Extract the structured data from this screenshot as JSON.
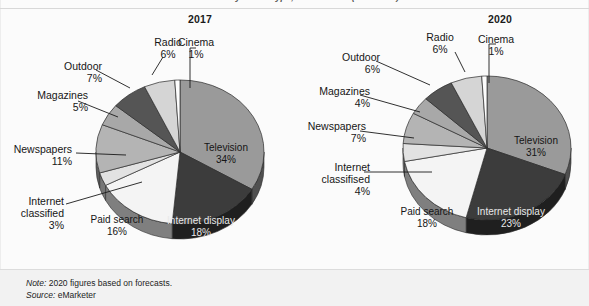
{
  "figure": {
    "clipped_header": "ad share by media type, 2017 & 2020 (% of total)",
    "note": {
      "lead": "Note:",
      "text": " 2020 figures based on forecasts."
    },
    "source": {
      "lead": "Source:",
      "text": " eMarketer"
    }
  },
  "panels": {
    "left": {
      "title": "2017"
    },
    "right": {
      "title": "2020"
    }
  },
  "labels": {
    "y2017": {
      "cinema": {
        "name": "Cinema",
        "pct": "1%"
      },
      "radio": {
        "name": "Radio",
        "pct": "6%"
      },
      "outdoor": {
        "name": "Outdoor",
        "pct": "7%"
      },
      "magazines": {
        "name": "Magazines",
        "pct": "5%"
      },
      "newspapers": {
        "name": "Newspapers",
        "pct": "11%"
      },
      "internet_classified": {
        "name1": "Internet",
        "name2": "classified",
        "pct": "3%"
      },
      "paid_search": {
        "name": "Paid search",
        "pct": "16%"
      },
      "internet_display": {
        "name": "Internet display",
        "pct": "18%"
      },
      "television": {
        "name": "Television",
        "pct": "34%"
      }
    },
    "y2020": {
      "cinema": {
        "name": "Cinema",
        "pct": "1%"
      },
      "radio": {
        "name": "Radio",
        "pct": "6%"
      },
      "outdoor": {
        "name": "Outdoor",
        "pct": "6%"
      },
      "magazines": {
        "name": "Magazines",
        "pct": "4%"
      },
      "newspapers": {
        "name": "Newspapers",
        "pct": "7%"
      },
      "internet_classified": {
        "name1": "Internet",
        "name2": "classifised",
        "pct": "4%"
      },
      "paid_search": {
        "name": "Paid search",
        "pct": "18%"
      },
      "internet_display": {
        "name": "Internet display",
        "pct": "23%"
      },
      "television": {
        "name": "Television",
        "pct": "31%"
      }
    }
  },
  "chart_data": {
    "type": "pie",
    "title": "ad share by media type, 2017 & 2020 (% of total)",
    "note": "2020 figures based on forecasts.",
    "source": "eMarketer",
    "unit": "% of total",
    "categories": [
      "Television",
      "Internet display",
      "Paid search",
      "Internet classified",
      "Newspapers",
      "Magazines",
      "Outdoor",
      "Radio",
      "Cinema"
    ],
    "charts": [
      {
        "title": "2017",
        "categories": [
          "Television",
          "Internet display",
          "Paid search",
          "Internet classified",
          "Newspapers",
          "Magazines",
          "Outdoor",
          "Radio",
          "Cinema"
        ],
        "values": [
          34,
          18,
          16,
          3,
          11,
          5,
          7,
          6,
          1
        ],
        "colors": [
          "#9a9a9a",
          "#3c3c3c",
          "#f4f4f4",
          "#e2e2e2",
          "#b4b4b4",
          "#a8a8a8",
          "#555555",
          "#d5d5d5",
          "#fdfdfd"
        ]
      },
      {
        "title": "2020",
        "categories": [
          "Television",
          "Internet display",
          "Paid search",
          "Internet classified",
          "Newspapers",
          "Magazines",
          "Outdoor",
          "Radio",
          "Cinema"
        ],
        "values": [
          31,
          23,
          18,
          4,
          7,
          4,
          6,
          6,
          1
        ],
        "colors": [
          "#9a9a9a",
          "#3c3c3c",
          "#f4f4f4",
          "#e2e2e2",
          "#b4b4b4",
          "#a8a8a8",
          "#555555",
          "#d5d5d5",
          "#fdfdfd"
        ]
      }
    ],
    "start_angle_deg": -90,
    "direction": "clockwise",
    "legend": "none",
    "style": "3d-pie-grayscale"
  }
}
